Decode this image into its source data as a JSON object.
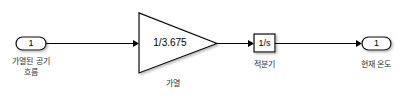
{
  "diagram": {
    "inport": {
      "number": "1",
      "label_line1": "가열된 공기",
      "label_line2": "흐름"
    },
    "gain": {
      "value": "1/3.675",
      "label": "가열"
    },
    "integrator": {
      "value": "1/s",
      "label": "적분기"
    },
    "outport": {
      "number": "1",
      "label": "현재 온도"
    }
  },
  "colors": {
    "line": "#000000",
    "block_fill": "#ffffff",
    "label": "#333333"
  }
}
